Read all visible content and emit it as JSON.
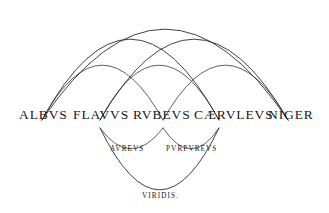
{
  "figure": {
    "background_color": "#ffffff",
    "stroke_color": "#2b2b2b"
  },
  "primary_colors": [
    {
      "label": "ALBVS",
      "x": 42,
      "y": 120
    },
    {
      "label": "FLAVVS",
      "x": 100,
      "y": 120
    },
    {
      "label": "RVBEVS",
      "x": 163,
      "y": 120
    },
    {
      "label": "CÆRVLEVS",
      "x": 219,
      "y": 120
    },
    {
      "label": "NIGER",
      "x": 288,
      "y": 120
    }
  ],
  "secondary_colors": [
    {
      "label": "AVREVS",
      "between": [
        "FLAVVS",
        "RVBEVS"
      ]
    },
    {
      "label": "PVRPVREVS",
      "between": [
        "RVBEVS",
        "CÆRVLEVS"
      ]
    }
  ],
  "tertiary_colors": [
    {
      "label": "VIRIDIS.",
      "between": [
        "FLAVVS",
        "CÆRVLEVS"
      ]
    }
  ],
  "upper_arcs": [
    {
      "from": "ALBVS",
      "to": "NIGER",
      "apex_y": 19
    },
    {
      "from": "ALBVS",
      "to": "CÆRVLEVS",
      "apex_y": 40
    },
    {
      "from": "FLAVVS",
      "to": "NIGER",
      "apex_y": 40
    },
    {
      "from": "ALBVS",
      "to": "RVBEVS",
      "apex_y": 68
    },
    {
      "from": "FLAVVS",
      "to": "CÆRVLEVS",
      "apex_y": 68
    },
    {
      "from": "RVBEVS",
      "to": "NIGER",
      "apex_y": 68
    }
  ],
  "lower_arcs": [
    {
      "from": "FLAVVS",
      "to": "RVBEVS",
      "apex_y": 146
    },
    {
      "from": "RVBEVS",
      "to": "CÆRVLEVS",
      "apex_y": 146
    },
    {
      "from": "FLAVVS",
      "to": "CÆRVLEVS",
      "apex_y": 190
    }
  ]
}
